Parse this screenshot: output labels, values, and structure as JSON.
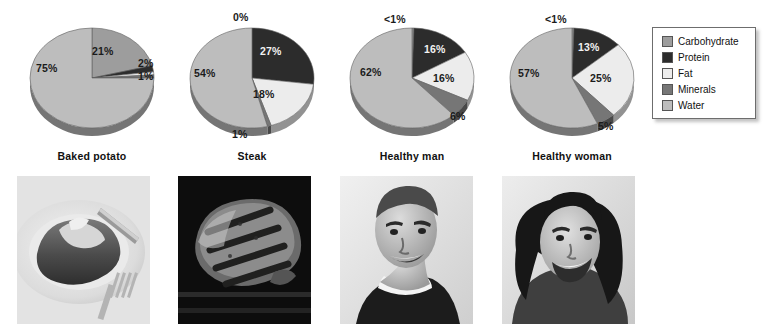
{
  "chart_data": [
    {
      "type": "pie",
      "title": "Baked potato",
      "categories": [
        "Carbohydrate",
        "Protein",
        "Fat",
        "Minerals",
        "Water"
      ],
      "values": [
        21,
        2,
        1,
        1,
        75
      ],
      "labels": [
        "21%",
        "2%",
        "1%",
        "1%",
        "75%"
      ],
      "xlabel": "",
      "ylabel": "",
      "legend_position": "right"
    },
    {
      "type": "pie",
      "title": "Steak",
      "categories": [
        "Carbohydrate",
        "Protein",
        "Fat",
        "Minerals",
        "Water"
      ],
      "values": [
        0,
        27,
        18,
        1,
        54
      ],
      "labels": [
        "0%",
        "27%",
        "18%",
        "1%",
        "54%"
      ],
      "xlabel": "",
      "ylabel": "",
      "legend_position": "right"
    },
    {
      "type": "pie",
      "title": "Healthy man",
      "categories": [
        "Carbohydrate",
        "Protein",
        "Fat",
        "Minerals",
        "Water"
      ],
      "values": [
        0.5,
        16,
        16,
        6,
        62
      ],
      "labels": [
        "<1%",
        "16%",
        "16%",
        "6%",
        "62%"
      ],
      "xlabel": "",
      "ylabel": "",
      "legend_position": "right"
    },
    {
      "type": "pie",
      "title": "Healthy woman",
      "categories": [
        "Carbohydrate",
        "Protein",
        "Fat",
        "Minerals",
        "Water"
      ],
      "values": [
        0.5,
        13,
        25,
        5,
        57
      ],
      "labels": [
        "<1%",
        "13%",
        "25%",
        "5%",
        "57%"
      ],
      "xlabel": "",
      "ylabel": "",
      "legend_position": "right"
    }
  ],
  "legend": {
    "items": [
      {
        "label": "Carbohydrate",
        "color": "#9d9d9d"
      },
      {
        "label": "Protein",
        "color": "#2c2c2c"
      },
      {
        "label": "Fat",
        "color": "#ececec"
      },
      {
        "label": "Minerals",
        "color": "#767676"
      },
      {
        "label": "Water",
        "color": "#bdbdbd"
      }
    ]
  },
  "columns": [
    {
      "label": "Baked potato",
      "photo_name": "baked-potato-photo",
      "slices": [
        {
          "label": "21%",
          "tone": "dark",
          "x": 80,
          "y": 46
        },
        {
          "label": "2%",
          "tone": "dark",
          "x": 126,
          "y": 58
        },
        {
          "label": "1%",
          "tone": "dark",
          "x": 126,
          "y": 71
        },
        {
          "label": "75%",
          "tone": "dark",
          "x": 24,
          "y": 63
        }
      ]
    },
    {
      "label": "Steak",
      "photo_name": "steak-photo",
      "slices": [
        {
          "label": "0%",
          "tone": "dark",
          "x": 61,
          "y": 12
        },
        {
          "label": "27%",
          "tone": "light",
          "x": 88,
          "y": 46
        },
        {
          "label": "18%",
          "tone": "dark",
          "x": 81,
          "y": 89
        },
        {
          "label": "1%",
          "tone": "dark",
          "x": 60,
          "y": 129
        },
        {
          "label": "54%",
          "tone": "dark",
          "x": 22,
          "y": 68
        }
      ]
    },
    {
      "label": "Healthy man",
      "photo_name": "healthy-man-photo",
      "slices": [
        {
          "label": "<1%",
          "tone": "dark",
          "x": 52,
          "y": 14
        },
        {
          "label": "16%",
          "tone": "light",
          "x": 92,
          "y": 44
        },
        {
          "label": "16%",
          "tone": "dark",
          "x": 101,
          "y": 73
        },
        {
          "label": "6%",
          "tone": "dark",
          "x": 118,
          "y": 111
        },
        {
          "label": "62%",
          "tone": "dark",
          "x": 28,
          "y": 67
        }
      ]
    },
    {
      "label": "Healthy woman",
      "photo_name": "healthy-woman-photo",
      "slices": [
        {
          "label": "<1%",
          "tone": "dark",
          "x": 53,
          "y": 14
        },
        {
          "label": "13%",
          "tone": "light",
          "x": 86,
          "y": 42
        },
        {
          "label": "25%",
          "tone": "dark",
          "x": 98,
          "y": 73
        },
        {
          "label": "5%",
          "tone": "dark",
          "x": 106,
          "y": 121
        },
        {
          "label": "57%",
          "tone": "dark",
          "x": 26,
          "y": 68
        }
      ]
    }
  ]
}
